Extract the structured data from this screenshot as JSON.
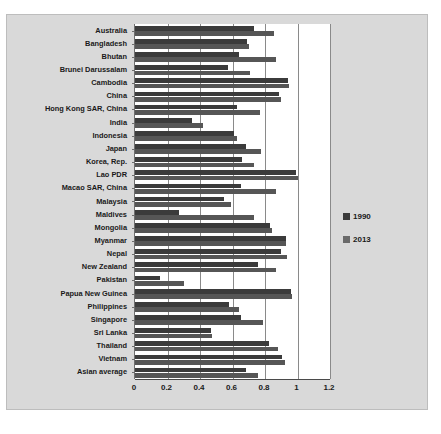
{
  "chart_data": {
    "type": "bar",
    "orientation": "horizontal",
    "title": "",
    "xlabel": "",
    "ylabel": "",
    "xlim": [
      0,
      1.2
    ],
    "grid": true,
    "legend_position": "right",
    "xticks": [
      "0",
      "0.2",
      "0.4",
      "0.6",
      "0.8",
      "1",
      "1.2"
    ],
    "xtick_values": [
      0,
      0.2,
      0.4,
      0.6,
      0.8,
      1,
      1.2
    ],
    "categories": [
      "Australia",
      "Bangladesh",
      "Bhutan",
      "Brunei Darussalam",
      "Cambodia",
      "China",
      "Hong Kong SAR, China",
      "India",
      "Indonesia",
      "Japan",
      "Korea, Rep.",
      "Lao PDR",
      "Macao SAR, China",
      "Malaysia",
      "Maldives",
      "Mongolia",
      "Myanmar",
      "Nepal",
      "New Zealand",
      "Pakistan",
      "Papua New Guinea",
      "Philippines",
      "Singapore",
      "Sri Lanka",
      "Thailand",
      "Vietnam",
      "Asian average"
    ],
    "series": [
      {
        "name": "1990",
        "color": "#3b3b3b",
        "values": [
          0.73,
          0.69,
          0.64,
          0.57,
          0.94,
          0.885,
          0.625,
          0.35,
          0.61,
          0.685,
          0.66,
          0.99,
          0.65,
          0.545,
          0.27,
          0.83,
          0.93,
          0.9,
          0.755,
          0.155,
          0.96,
          0.58,
          0.655,
          0.465,
          0.825,
          0.905,
          0.685
        ]
      },
      {
        "name": "2013",
        "color": "#565656",
        "values": [
          0.855,
          0.7,
          0.87,
          0.71,
          0.95,
          0.9,
          0.77,
          0.42,
          0.625,
          0.775,
          0.73,
          1.0,
          0.87,
          0.59,
          0.735,
          0.845,
          0.93,
          0.935,
          0.865,
          0.3,
          0.965,
          0.64,
          0.785,
          0.475,
          0.88,
          0.92,
          0.755
        ]
      }
    ]
  },
  "legend": {
    "items": [
      {
        "label": "1990"
      },
      {
        "label": "2013"
      }
    ]
  },
  "caption": {
    "text": ""
  }
}
